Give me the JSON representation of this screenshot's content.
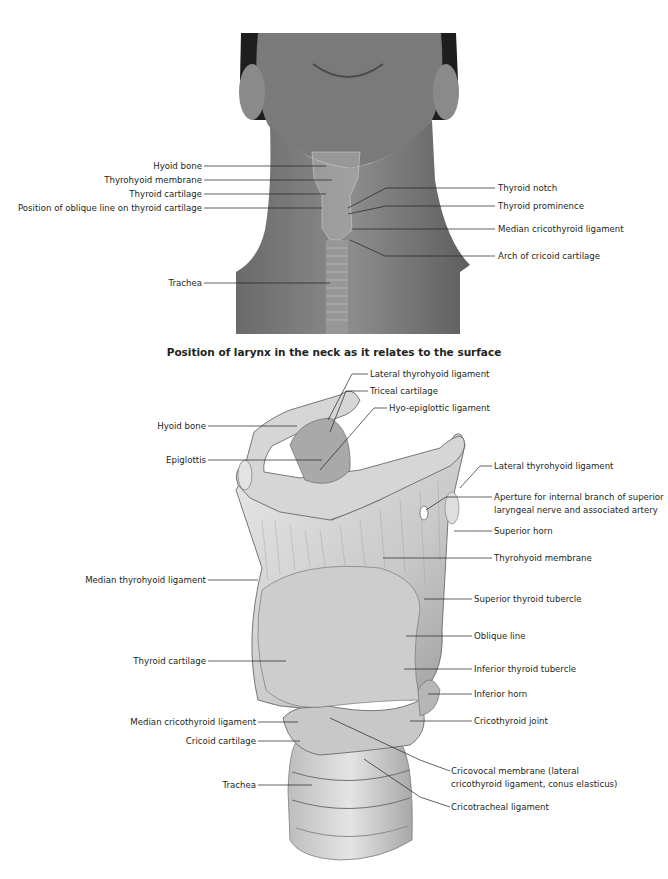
{
  "figure_top": {
    "description": "Photograph of neck with larynx overlay",
    "labels_left": [
      {
        "text": "Hyoid bone",
        "y": 166
      },
      {
        "text": "Thyrohyoid membrane",
        "y": 180
      },
      {
        "text": "Thyroid cartilage",
        "y": 194
      },
      {
        "text": "Position of oblique line on thyroid cartilage",
        "y": 208
      },
      {
        "text": "Trachea",
        "y": 283
      }
    ],
    "labels_right": [
      {
        "text": "Thyroid notch",
        "y": 188
      },
      {
        "text": "Thyroid prominence",
        "y": 206
      },
      {
        "text": "Median cricothyroid ligament",
        "y": 229
      },
      {
        "text": "Arch of cricoid cartilage",
        "y": 256
      }
    ],
    "caption": "Position of larynx in the neck as it relates to the surface"
  },
  "figure_bottom": {
    "description": "Anterolateral view of the larynx",
    "labels_top": [
      {
        "text": "Lateral thyrohyoid ligament",
        "y": 374
      },
      {
        "text": "Triceal cartilage",
        "y": 391
      },
      {
        "text": "Hyo-epiglottic ligament",
        "y": 408
      }
    ],
    "labels_left": [
      {
        "text": "Hyoid bone",
        "y": 426
      },
      {
        "text": "Epiglottis",
        "y": 460
      },
      {
        "text": "Median thyrohyoid ligament",
        "y": 580
      },
      {
        "text": "Thyroid cartilage",
        "y": 661
      },
      {
        "text": "Median cricothyroid ligament",
        "y": 722
      },
      {
        "text": "Cricoid cartilage",
        "y": 741
      },
      {
        "text": "Trachea",
        "y": 785
      }
    ],
    "labels_right": [
      {
        "text": "Lateral thyrohyoid ligament",
        "y": 466
      },
      {
        "text": "Aperture for internal branch of superior",
        "y": 497
      },
      {
        "text": "laryngeal nerve and associated artery",
        "y": 510
      },
      {
        "text": "Superior horn",
        "y": 531
      },
      {
        "text": "Thyrohyoid membrane",
        "y": 558
      },
      {
        "text": "Superior thyroid tubercle",
        "y": 599
      },
      {
        "text": "Oblique line",
        "y": 636
      },
      {
        "text": "Inferior thyroid tubercle",
        "y": 669
      },
      {
        "text": "Inferior horn",
        "y": 694
      },
      {
        "text": "Cricothyroid joint",
        "y": 721
      },
      {
        "text": "Cricovocal membrane (lateral",
        "y": 771
      },
      {
        "text": "cricothyroid ligament, conus elasticus)",
        "y": 784
      },
      {
        "text": "Cricotracheal ligament",
        "y": 807
      }
    ]
  }
}
